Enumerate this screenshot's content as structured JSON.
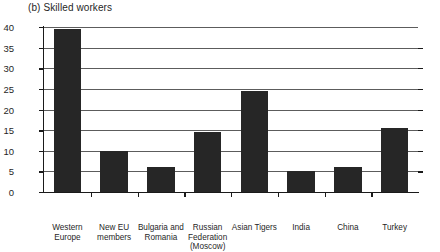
{
  "chart_data": {
    "type": "bar",
    "title": "(b) Skilled workers",
    "xlabel": "",
    "ylabel": "",
    "ylim": [
      0,
      40
    ],
    "ytick_step": 5,
    "yticks": [
      0,
      5,
      10,
      15,
      20,
      25,
      30,
      35,
      40
    ],
    "grid": true,
    "legend": "none",
    "bar_color": "#262626",
    "categories": [
      "Western Europe",
      "New EU members",
      "Bulgaria and Romania",
      "Russian Federation (Moscow)",
      "Asian Tigers",
      "India",
      "China",
      "Turkey"
    ],
    "values": [
      39.5,
      10,
      6,
      14.5,
      24.5,
      5,
      6,
      15.5
    ]
  },
  "axis": {
    "ytick_labels": [
      "0",
      "5",
      "10",
      "15",
      "20",
      "25",
      "30",
      "35",
      "40"
    ]
  }
}
